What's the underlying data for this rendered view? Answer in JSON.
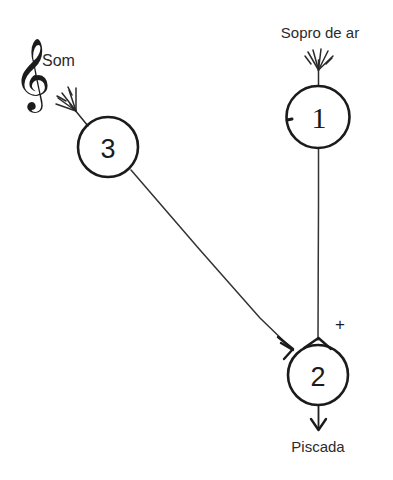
{
  "diagram": {
    "background_color": "#ffffff",
    "ink_color": "#1b1b1b",
    "nodes": [
      {
        "id": "node-1",
        "label": "1",
        "cx": 318,
        "cy": 117,
        "r": 31,
        "input_label": "Sopro de ar",
        "marker": "fan-arrowhead"
      },
      {
        "id": "node-3",
        "label": "3",
        "cx": 108,
        "cy": 147,
        "r": 30,
        "input_label": "Som",
        "marker": "fan-arrowhead"
      },
      {
        "id": "node-2",
        "label": "2",
        "cx": 318,
        "cy": 375,
        "r": 30,
        "output_label": "Piscada",
        "marker": "open-arrowhead"
      }
    ],
    "edges": [
      {
        "id": "edge-1-to-2",
        "from": "node-1",
        "to": "node-2",
        "sign": "+",
        "kind": "vertical"
      },
      {
        "id": "edge-3-to-2",
        "from": "node-3",
        "to": "node-2",
        "sign": "",
        "kind": "diagonal"
      },
      {
        "id": "edge-2-to-output",
        "from": "node-2",
        "to": "output-piscada",
        "sign": "",
        "kind": "vertical-out"
      }
    ],
    "labels": {
      "sopro_de_ar": "Sopro de ar",
      "som": "Som",
      "piscada": "Piscada",
      "plus_sign": "+",
      "clef_symbol": "𝄞",
      "node_1": "1",
      "node_2": "2",
      "node_3": "3"
    },
    "icons": {
      "music_clef": "treble-clef-icon",
      "fan_arrow": "fan-arrowhead-icon",
      "down_arrow": "down-arrow-icon"
    }
  }
}
